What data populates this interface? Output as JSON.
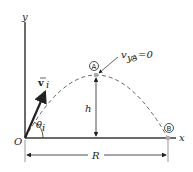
{
  "diagram": {
    "labels": {
      "y_axis": "y",
      "x_axis": "x",
      "origin": "O",
      "velocity": "v",
      "velocity_sub": "i",
      "angle": "θ",
      "angle_sub": "i",
      "height": "h",
      "range": "R",
      "point_a": "A",
      "point_b": "B",
      "vy_label": "v",
      "vy_sub": "y",
      "vy_sub_point": "A",
      "vy_value": "=0"
    },
    "colors": {
      "axis": "#3a3a3a",
      "trajectory": "#555555",
      "point_fill": "#aaaaaa"
    }
  }
}
